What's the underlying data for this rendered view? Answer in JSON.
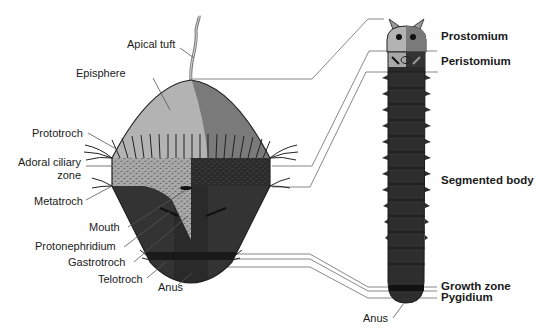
{
  "diagram": {
    "larva": {
      "labels": {
        "apical_tuft": "Apical tuft",
        "episphere": "Episphere",
        "prototroch": "Prototroch",
        "adoral_ciliary_zone_1": "Adoral ciliary",
        "adoral_ciliary_zone_2": "zone",
        "metatroch": "Metatroch",
        "mouth": "Mouth",
        "protonephridium": "Protonephridium",
        "gastrotroch": "Gastrotroch",
        "telotroch": "Telotroch",
        "anus": "Anus"
      }
    },
    "adult": {
      "labels": {
        "prostomium": "Prostomium",
        "peristomium": "Peristomium",
        "segmented_body": "Segmented body",
        "growth_zone": "Growth zone",
        "pygidium": "Pygidium",
        "anus": "Anus"
      },
      "segment_count": 13
    },
    "colors": {
      "episphere_light": "#b3b3b3",
      "episphere_dark": "#7a7a7a",
      "adoral_light": "#a8a8a8",
      "hyposphere_dark": "#333333",
      "body_dark": "#2e2e2e",
      "segment_line": "#1a1a1a",
      "connector_line": "#666666",
      "label_text": "#1a1a1a"
    }
  }
}
